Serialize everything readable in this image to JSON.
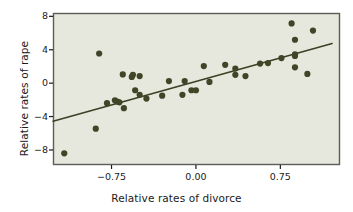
{
  "chart_data": {
    "type": "scatter",
    "title": "",
    "xlabel": "Relative rates of divorce",
    "ylabel": "Relative rates of rape",
    "xticks": [
      -0.75,
      0.0,
      0.75
    ],
    "xtick_labels": [
      "−0.75",
      "0.00",
      "0.75"
    ],
    "yticks": [
      -8,
      -4,
      0,
      4,
      8
    ],
    "ytick_labels": [
      "−8",
      "−4",
      "0",
      "4",
      "8"
    ],
    "xlim": [
      -1.27,
      1.28
    ],
    "ylim": [
      -9.8,
      8.4
    ],
    "grid": false,
    "legend": null,
    "point_color": "#3f4526",
    "line_color": "#3a4024",
    "plot_background": "#e6e7dd",
    "frame_color": "#5c5c58",
    "marker_size": 3.1,
    "points": [
      [
        -1.17,
        -8.4
      ],
      [
        -0.89,
        -5.45
      ],
      [
        -0.86,
        3.55
      ],
      [
        -0.79,
        -2.4
      ],
      [
        -0.72,
        -2.05
      ],
      [
        -0.7,
        -2.2
      ],
      [
        -0.68,
        -2.3
      ],
      [
        -0.64,
        -3.0
      ],
      [
        -0.65,
        1.05
      ],
      [
        -0.57,
        0.75
      ],
      [
        -0.56,
        1.0
      ],
      [
        -0.54,
        -0.85
      ],
      [
        -0.5,
        0.85
      ],
      [
        -0.5,
        -1.4
      ],
      [
        -0.44,
        -1.85
      ],
      [
        -0.3,
        -1.5
      ],
      [
        -0.24,
        0.25
      ],
      [
        -0.12,
        -1.4
      ],
      [
        -0.1,
        0.25
      ],
      [
        -0.04,
        -0.85
      ],
      [
        0.0,
        -0.85
      ],
      [
        0.07,
        2.05
      ],
      [
        0.12,
        0.15
      ],
      [
        0.26,
        2.2
      ],
      [
        0.35,
        1.75
      ],
      [
        0.35,
        1.0
      ],
      [
        0.44,
        0.85
      ],
      [
        0.57,
        2.35
      ],
      [
        0.64,
        2.4
      ],
      [
        0.76,
        3.0
      ],
      [
        0.85,
        7.15
      ],
      [
        0.88,
        5.2
      ],
      [
        0.88,
        3.45
      ],
      [
        0.88,
        3.25
      ],
      [
        0.88,
        1.9
      ],
      [
        0.99,
        1.1
      ],
      [
        1.04,
        6.3
      ]
    ],
    "fit_line": {
      "x_start": -1.27,
      "y_start": -4.55,
      "x_end": 1.21,
      "y_end": 4.75
    }
  },
  "plot_geometry": {
    "frame_left": 53,
    "frame_top": 13,
    "frame_right": 340,
    "frame_bottom": 165
  }
}
